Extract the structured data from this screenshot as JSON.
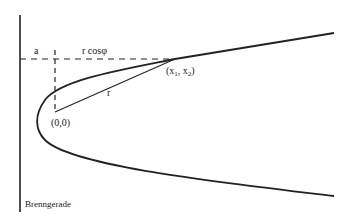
{
  "diagram": {
    "type": "parabola-polar-geometry",
    "colors": {
      "line": "#222222",
      "background": "#ffffff"
    },
    "labels": {
      "a": "a",
      "r_cos_phi": "r cosφ",
      "point_x": "(x",
      "point_sub1": "1",
      "point_mid": ", x",
      "point_sub2": "2",
      "point_close": ")",
      "r": "r",
      "origin": "(0,0)",
      "directrix": "Brenngerade"
    },
    "elements": {
      "directrix_line": {
        "x": 20,
        "y1": 15,
        "y2": 212
      },
      "horizontal_dashed": {
        "y": 59,
        "x1": 20,
        "x2": 175
      },
      "vertical_dashed": {
        "x": 55,
        "y1": 50,
        "y2": 112
      },
      "focus": {
        "x": 55,
        "y": 112
      },
      "point": {
        "x": 175,
        "y": 59
      },
      "parabola": {
        "vertex": [
          37,
          120
        ],
        "upper_end": [
          334,
          33
        ],
        "lower_end": [
          334,
          196
        ]
      }
    }
  }
}
